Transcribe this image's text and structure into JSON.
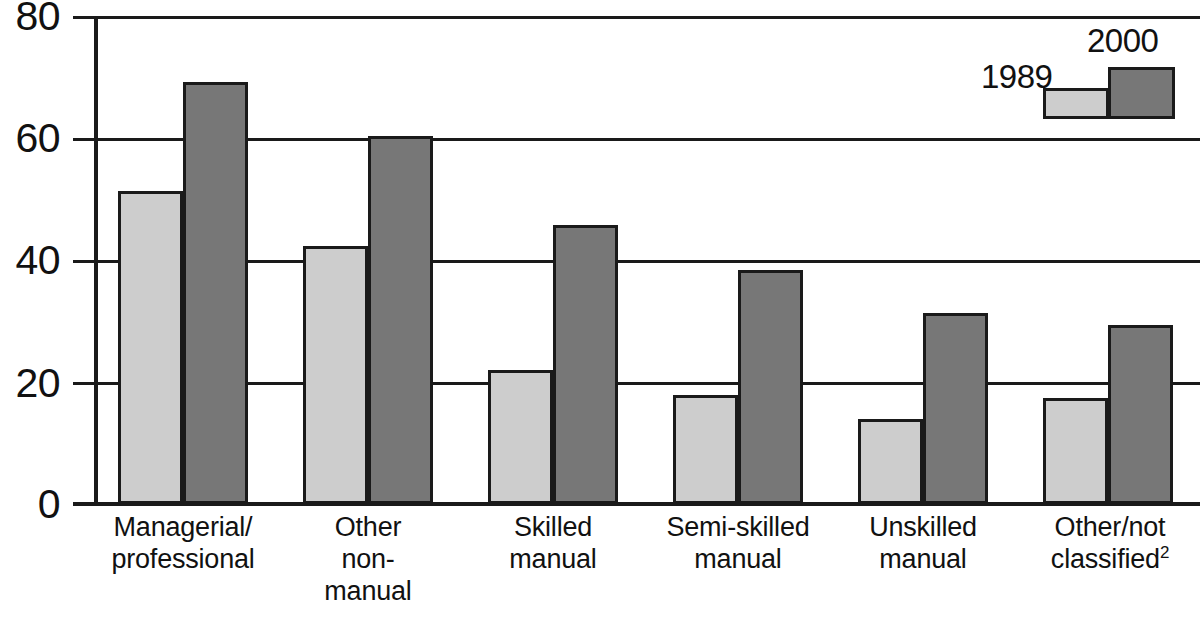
{
  "chart_data": {
    "type": "bar",
    "title": "",
    "subtitle": "",
    "xlabel": "",
    "ylabel": "",
    "ylim": [
      0,
      80
    ],
    "yticks": [
      0,
      20,
      40,
      60,
      80
    ],
    "grid": true,
    "legend_position": "top-right",
    "categories": [
      "Managerial/\nprofessional",
      "Other\nnon-\nmanual",
      "Skilled\nmanual",
      "Semi-skilled\nmanual",
      "Unskilled\nmanual",
      "Other/not\nclassified2"
    ],
    "category_lines": [
      [
        "Managerial/",
        "professional"
      ],
      [
        "Other",
        "non-",
        "manual"
      ],
      [
        "Skilled",
        "manual"
      ],
      [
        "Semi-skilled",
        "manual"
      ],
      [
        "Unskilled",
        "manual"
      ],
      [
        "Other/not",
        "classified"
      ]
    ],
    "category_footnote_marker": "2",
    "series": [
      {
        "name": "1989",
        "color": "#cdcdcd",
        "values": [
          51.5,
          42.5,
          22,
          18,
          14,
          17.5
        ]
      },
      {
        "name": "2000",
        "color": "#777777",
        "values": [
          69.5,
          60.5,
          46,
          38.5,
          31.5,
          29.5
        ]
      }
    ]
  },
  "axis": {
    "y_tick_labels": [
      "80",
      "60",
      "40",
      "20",
      "0"
    ]
  },
  "legend": {
    "entries": [
      {
        "label": "1989",
        "color": "#cdcdcd"
      },
      {
        "label": "2000",
        "color": "#777777"
      }
    ]
  },
  "colors": {
    "series_1989": "#cdcdcd",
    "series_2000": "#777777",
    "axis": "#1a1a1a",
    "text": "#111111",
    "background": "#ffffff"
  }
}
